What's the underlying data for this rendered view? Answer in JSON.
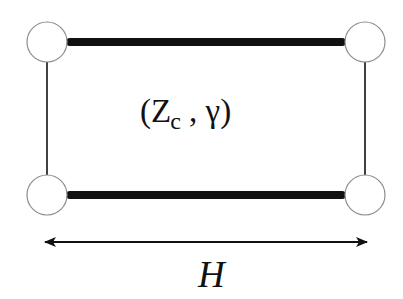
{
  "diagram": {
    "type": "transmission-line-rectangle",
    "center_label": {
      "open_paren": "(",
      "impedance_symbol": "Z",
      "impedance_subscript": "c",
      "separator": " , ",
      "propagation_symbol": "γ",
      "close_paren": ")"
    },
    "dimension_label": "H",
    "nodes": [
      {
        "id": "top-left",
        "cx": 47,
        "cy": 42,
        "r": 20
      },
      {
        "id": "top-right",
        "cx": 365,
        "cy": 42,
        "r": 20
      },
      {
        "id": "bottom-left",
        "cx": 47,
        "cy": 195,
        "r": 20
      },
      {
        "id": "bottom-right",
        "cx": 365,
        "cy": 195,
        "r": 20
      }
    ],
    "thick_lines": [
      {
        "id": "top-conductor",
        "x1": 68,
        "y1": 42,
        "x2": 344,
        "y2": 42,
        "width": 8
      },
      {
        "id": "bottom-conductor",
        "x1": 68,
        "y1": 195,
        "x2": 344,
        "y2": 195,
        "width": 8
      }
    ],
    "thin_lines": [
      {
        "id": "left-side",
        "x1": 47,
        "y1": 62,
        "x2": 47,
        "y2": 175,
        "width": 1.6
      },
      {
        "id": "right-side",
        "x1": 365,
        "y1": 62,
        "x2": 365,
        "y2": 175,
        "width": 1.6
      }
    ],
    "dimension_arrow": {
      "x1": 44,
      "x2": 368,
      "y": 242
    },
    "colors": {
      "stroke": "#111111",
      "node_stroke": "#8c8c8c",
      "node_fill": "#ffffff",
      "background": "#ffffff"
    }
  }
}
